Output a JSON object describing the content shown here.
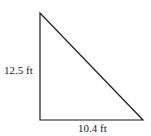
{
  "diagram": {
    "type": "right-triangle",
    "vertices": {
      "top": [
        40,
        13
      ],
      "bottom_left": [
        40,
        120
      ],
      "bottom_right": [
        143,
        120
      ]
    },
    "stroke_color": "#1a1a1a",
    "labels": {
      "height": "12.5 ft",
      "base": "10.4 ft"
    }
  }
}
